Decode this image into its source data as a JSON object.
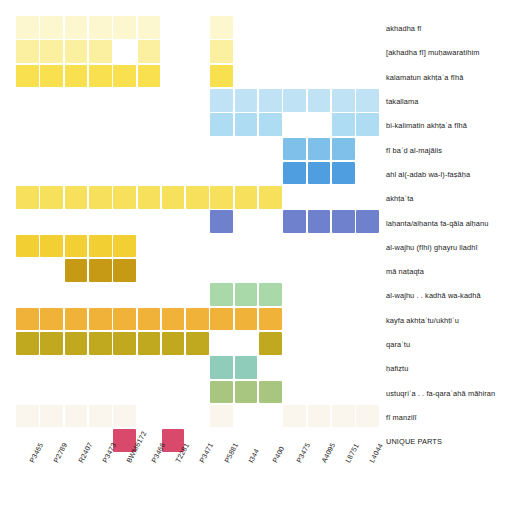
{
  "chart_data": {
    "type": "heatmap",
    "title": "",
    "xlabel": "",
    "ylabel": "",
    "grid": false,
    "legend": "none",
    "categories": [
      "P3465",
      "P2789",
      "R2407",
      "P3473",
      "BWM6172",
      "P3466",
      "T2281",
      "P3471",
      "P5881",
      "I344",
      "P400",
      "P3475",
      "A4095",
      "L8751",
      "L4044"
    ],
    "rows": [
      "akhadha fī",
      "[akhadha fī] muḥawaratihim",
      "kalamatun akhṭaʾa fīhā",
      "takallama",
      "bi-kalimatin akhṭaʾa fīhā",
      "fī baʿḍ al-majālis",
      "ahl al(-adab wa-l)-faṣāḥa",
      "akhṭaʾta",
      "laḥanta/alḥanta fa-qāla alḥanu",
      "al-wajhu (fīhi) ghayru lladhī",
      "mā naṭaqta",
      "al-wajhu . . kadhā wa-kadhā",
      "kayfa akhṭaʾtu/ukhṭiʾu",
      "qaraʾtu",
      "ḥafiẓtu",
      "ustuqriʾa . . fa-qaraʾahā māhiran",
      "fī manzilī",
      "UNIQUE PARTS"
    ],
    "colors": {
      "pale_cream": "#fcf7cf",
      "light_yellow": "#faf0a0",
      "yellow": "#f8e04f",
      "yellow_mid": "#f7e05c",
      "gold": "#f2cf33",
      "dark_gold": "#c79a15",
      "orange": "#f0b238",
      "olive": "#c1a91f",
      "pale_blue": "#bfe2f5",
      "light_blue": "#aedcf2",
      "mid_blue": "#7ec0ea",
      "strong_blue": "#4f9fe0",
      "periwinkle": "#6f80cc",
      "mint": "#a9d9a8",
      "teal": "#8fcdba",
      "sage": "#a8c680",
      "ghost": "#fbf8f2",
      "crimson": "#d9496b"
    },
    "cells": [
      {
        "row": 0,
        "cols": [
          0,
          1,
          2,
          3,
          4,
          5
        ],
        "color": "#fcf7cf"
      },
      {
        "row": 0,
        "cols": [
          8
        ],
        "color": "#fcf7cf"
      },
      {
        "row": 1,
        "cols": [
          0,
          1,
          2,
          3
        ],
        "color": "#faf0a0"
      },
      {
        "row": 1,
        "cols": [
          5
        ],
        "color": "#faf0a0"
      },
      {
        "row": 1,
        "cols": [
          8
        ],
        "color": "#faf0a0"
      },
      {
        "row": 2,
        "cols": [
          0,
          1,
          2,
          3,
          4,
          5
        ],
        "color": "#f8e04f"
      },
      {
        "row": 2,
        "cols": [
          8
        ],
        "color": "#f8e04f"
      },
      {
        "row": 3,
        "cols": [
          8,
          9,
          10,
          11,
          12,
          13,
          14
        ],
        "color": "#bfe2f5"
      },
      {
        "row": 4,
        "cols": [
          8,
          9,
          10
        ],
        "color": "#aedcf2"
      },
      {
        "row": 4,
        "cols": [
          13,
          14
        ],
        "color": "#aedcf2"
      },
      {
        "row": 5,
        "cols": [
          11,
          12,
          13
        ],
        "color": "#7ec0ea"
      },
      {
        "row": 6,
        "cols": [
          11,
          12,
          13
        ],
        "color": "#4f9fe0"
      },
      {
        "row": 7,
        "cols": [
          0,
          1,
          2,
          3,
          4,
          5,
          6,
          7,
          8,
          9,
          10
        ],
        "color": "#f7e05c"
      },
      {
        "row": 8,
        "cols": [
          8
        ],
        "color": "#6f80cc"
      },
      {
        "row": 8,
        "cols": [
          11,
          12,
          13,
          14
        ],
        "color": "#6f80cc"
      },
      {
        "row": 9,
        "cols": [
          0,
          1,
          2,
          3,
          4
        ],
        "color": "#f2cf33"
      },
      {
        "row": 10,
        "cols": [
          2,
          3,
          4
        ],
        "color": "#c79a15"
      },
      {
        "row": 11,
        "cols": [
          8,
          9,
          10
        ],
        "color": "#a9d9a8"
      },
      {
        "row": 12,
        "cols": [
          0,
          1,
          2,
          3,
          4,
          5,
          6,
          7,
          8,
          9,
          10
        ],
        "color": "#f0b238"
      },
      {
        "row": 13,
        "cols": [
          0,
          1,
          2,
          3,
          4,
          5,
          6,
          7
        ],
        "color": "#c1a91f"
      },
      {
        "row": 13,
        "cols": [
          10
        ],
        "color": "#c1a91f"
      },
      {
        "row": 14,
        "cols": [
          8,
          9
        ],
        "color": "#8fcdba"
      },
      {
        "row": 15,
        "cols": [
          8,
          9,
          10
        ],
        "color": "#a8c680"
      },
      {
        "row": 16,
        "cols": [
          0,
          1,
          2,
          3,
          4
        ],
        "color": "#faf5ed"
      },
      {
        "row": 16,
        "cols": [
          8
        ],
        "color": "#faf5ed"
      },
      {
        "row": 16,
        "cols": [
          11,
          12,
          13,
          14
        ],
        "color": "#faf5ed"
      },
      {
        "row": 17,
        "cols": [
          4
        ],
        "color": "#d9496b"
      },
      {
        "row": 17,
        "cols": [
          6
        ],
        "color": "#d9496b"
      }
    ],
    "layout": {
      "origin_x": 16,
      "origin_y": 17,
      "cell_w": 24.3,
      "cell_h": 24.3,
      "cell_gap": 1.6,
      "n_cols": 15,
      "n_rows": 18
    }
  }
}
